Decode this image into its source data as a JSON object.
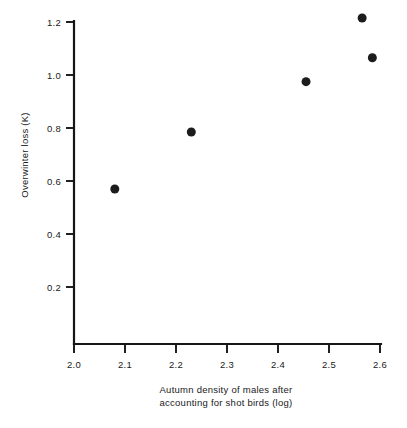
{
  "chart_data": {
    "type": "scatter",
    "title": "",
    "xlabel": "Autumn density of males after accounting for shot birds (log)",
    "xlabel_line1": "Autumn density of males after",
    "xlabel_line2": "accounting for shot birds (log)",
    "ylabel": "Overwinter loss (K)",
    "xlim": [
      2.0,
      2.6
    ],
    "ylim": [
      0.0,
      1.2
    ],
    "xticks": [
      2.0,
      2.1,
      2.2,
      2.3,
      2.4,
      2.5,
      2.6
    ],
    "xtick_labels": [
      "2.0",
      "2.1",
      "2.2",
      "2.3",
      "2.4",
      "2.5",
      "2.6"
    ],
    "yticks": [
      0.2,
      0.4,
      0.6,
      0.8,
      1.0,
      1.2
    ],
    "ytick_labels": [
      "0.2",
      "0.4",
      "0.6",
      "0.8",
      "1.0",
      "1.2"
    ],
    "grid": false,
    "legend": false,
    "marker": "filled-circle",
    "marker_color": "#1c1c1c",
    "marker_size": 9,
    "points": [
      {
        "x": 2.08,
        "y": 0.57
      },
      {
        "x": 2.23,
        "y": 0.785
      },
      {
        "x": 2.455,
        "y": 0.975
      },
      {
        "x": 2.565,
        "y": 1.215
      },
      {
        "x": 2.585,
        "y": 1.065
      }
    ],
    "x": [
      2.08,
      2.23,
      2.455,
      2.565,
      2.585
    ],
    "values": [
      0.57,
      0.785,
      0.975,
      1.215,
      1.065
    ]
  }
}
